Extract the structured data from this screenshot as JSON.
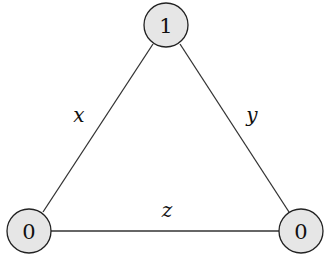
{
  "diagram": {
    "type": "graph",
    "nodes": [
      {
        "id": "top",
        "label": "1",
        "cx": 166,
        "cy": 25
      },
      {
        "id": "bottom-left",
        "label": "0",
        "cx": 29,
        "cy": 231
      },
      {
        "id": "bottom-right",
        "label": "0",
        "cx": 301,
        "cy": 231
      }
    ],
    "edges": [
      {
        "from": "top",
        "to": "bottom-left",
        "label": "x"
      },
      {
        "from": "top",
        "to": "bottom-right",
        "label": "y"
      },
      {
        "from": "bottom-left",
        "to": "bottom-right",
        "label": "z"
      }
    ],
    "colors": {
      "node_fill": "#e6e6e6",
      "stroke": "#222222"
    }
  }
}
